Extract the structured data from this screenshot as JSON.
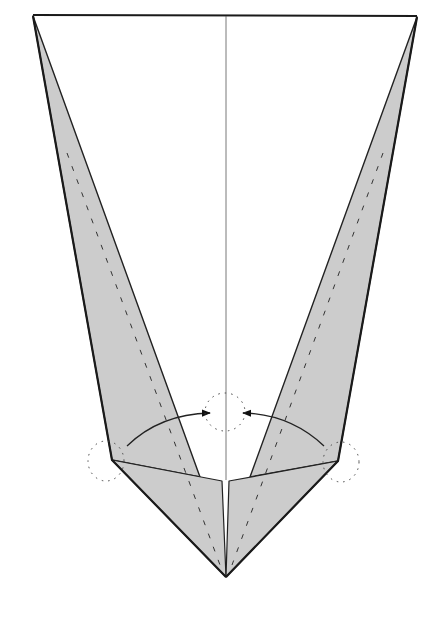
{
  "diagram": {
    "type": "origami-step",
    "colors": {
      "background": "#ffffff",
      "paper_front": "#ffffff",
      "paper_back": "#cccccc",
      "edge": "#222222",
      "center_crease": "#555555",
      "dashed": "#333333"
    },
    "points": {
      "top_left": [
        33,
        16
      ],
      "top_right": [
        417,
        17
      ],
      "left_elbow": [
        112,
        460
      ],
      "right_elbow": [
        338,
        461
      ],
      "bottom": [
        226,
        577
      ],
      "left_inner_bottom": [
        200,
        477
      ],
      "right_inner_bottom": [
        250,
        477
      ],
      "left_center": [
        222,
        481
      ],
      "right_center": [
        229,
        481
      ],
      "center_top": [
        226,
        16
      ],
      "center_bottom": [
        226,
        480
      ]
    },
    "arrows": [
      {
        "name": "left-fold-arrow",
        "from": [
          127,
          446
        ],
        "ctrl": [
          165,
          414
        ],
        "to": [
          210,
          413
        ]
      },
      {
        "name": "right-fold-arrow",
        "from": [
          324,
          446
        ],
        "ctrl": [
          285,
          414
        ],
        "to": [
          243,
          413
        ]
      }
    ],
    "pivot_markers": [
      {
        "name": "left-pivot",
        "cx": 106,
        "cy": 461,
        "rx": 18,
        "ry": 20
      },
      {
        "name": "center-pivot",
        "cx": 225,
        "cy": 412,
        "rx": 20,
        "ry": 19
      },
      {
        "name": "right-pivot",
        "cx": 341,
        "cy": 462,
        "rx": 18,
        "ry": 20
      }
    ]
  }
}
